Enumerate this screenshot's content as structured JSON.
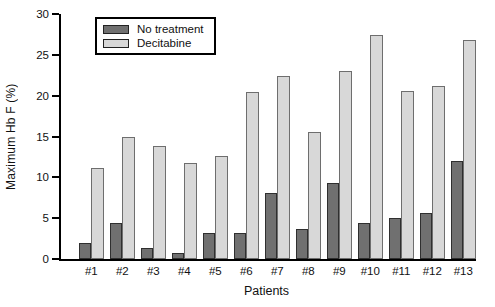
{
  "figure": {
    "background": "#ffffff",
    "axis_color": "#000000",
    "text_color": "#111111"
  },
  "chart_data": {
    "type": "bar",
    "title": "",
    "xlabel": "Patients",
    "ylabel": "Maximum Hb F (%)",
    "ylim": [
      0,
      30
    ],
    "yticks": [
      0,
      5,
      10,
      15,
      20,
      25,
      30
    ],
    "grid": false,
    "legend_position": "top-left",
    "categories": [
      "#1",
      "#2",
      "#3",
      "#4",
      "#5",
      "#6",
      "#7",
      "#8",
      "#9",
      "#10",
      "#11",
      "#12",
      "#13"
    ],
    "series": [
      {
        "name": "No treatment",
        "fill": "#707070",
        "border": "#2f2f2f",
        "values": [
          2.0,
          4.4,
          1.3,
          0.7,
          3.2,
          3.2,
          8.1,
          3.7,
          9.3,
          4.4,
          5.0,
          5.6,
          12.0
        ]
      },
      {
        "name": "Decitabine",
        "fill": "#d8d8d8",
        "border": "#6e6e6e",
        "values": [
          11.2,
          15.0,
          13.8,
          11.8,
          12.6,
          20.5,
          22.4,
          15.6,
          23.0,
          27.4,
          20.6,
          21.2,
          26.8
        ]
      }
    ]
  }
}
